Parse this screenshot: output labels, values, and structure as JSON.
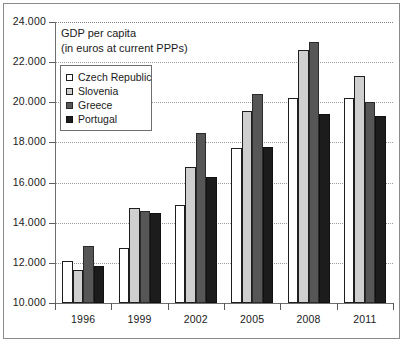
{
  "chart_data": {
    "type": "bar",
    "title_line1": "GDP per capita",
    "title_line2": "(in euros at current PPPs)",
    "xlabel": "",
    "ylabel": "",
    "ylim": [
      10000,
      24000
    ],
    "ytick_step": 2000,
    "grid": true,
    "legend_position": "top-left-inside",
    "categories": [
      "1996",
      "1999",
      "2002",
      "2005",
      "2008",
      "2011"
    ],
    "ytick_labels": [
      "10.000",
      "12.000",
      "14.000",
      "16.000",
      "18.000",
      "20.000",
      "22.000",
      "24.000"
    ],
    "ytick_values": [
      10000,
      12000,
      14000,
      16000,
      18000,
      20000,
      22000,
      24000
    ],
    "series": [
      {
        "name": "Czech Republic",
        "color": "#ffffff",
        "values": [
          12100,
          12750,
          14900,
          17700,
          20200,
          20200
        ]
      },
      {
        "name": "Slovenia",
        "color": "#cfcfcf",
        "values": [
          11650,
          14750,
          16800,
          19550,
          22600,
          21300
        ]
      },
      {
        "name": "Greece",
        "color": "#565656",
        "values": [
          12850,
          14600,
          18450,
          20400,
          23000,
          20000
        ]
      },
      {
        "name": "Portugal",
        "color": "#1c1c1c",
        "values": [
          11850,
          14500,
          16300,
          17750,
          19400,
          19300
        ]
      }
    ]
  },
  "legend": {
    "items": [
      {
        "label": "Czech Republic"
      },
      {
        "label": "Slovenia"
      },
      {
        "label": "Greece"
      },
      {
        "label": "Portugal"
      }
    ]
  }
}
